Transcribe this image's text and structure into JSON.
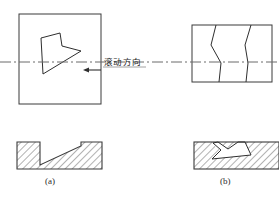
{
  "figure": {
    "background_color": "#ffffff",
    "line_color": "#3a3a3a",
    "centerline_color": "#6b6b6b",
    "hatch_color": "#555555",
    "text_color": "#1d1d1d",
    "width": 279,
    "height": 202
  },
  "annotations": {
    "rolling_direction_label": "滚动方向",
    "caption_a": "(a)",
    "caption_b": "(b)"
  },
  "views": {
    "top_view_a": {
      "name": "plan view a",
      "box": {
        "x": 19,
        "y": 14,
        "width": 82,
        "height": 90
      },
      "defect_outline_points": "41,38 60,33 63,46 80,50 44,74"
    },
    "top_view_b": {
      "name": "plan view b",
      "box": {
        "x": 192,
        "y": 25,
        "width": 80,
        "height": 57
      },
      "crack_left_points": "216,27 212,45 221,62 218,81",
      "crack_right_points": "250,27 245,45 248,62 246,81"
    },
    "section_a": {
      "name": "section view a",
      "block": {
        "x": 17,
        "y": 142,
        "width": 85,
        "height": 27
      },
      "groove_points": "40,142 40,165 81,146 81,142"
    },
    "section_b": {
      "name": "section view b",
      "block": {
        "x": 194,
        "y": 142,
        "width": 85,
        "height": 27
      },
      "crack_points": "218,142 238,142 245,142 251,155 212,159 228,148"
    }
  },
  "centerline": {
    "y": 62,
    "x_start": 0,
    "x_end": 279,
    "dash_pattern": "10 3 2 3"
  },
  "arrow": {
    "name": "rolling-direction-arrow",
    "direction": "left",
    "tail_x": 101,
    "head_x": 84,
    "y": 70
  }
}
